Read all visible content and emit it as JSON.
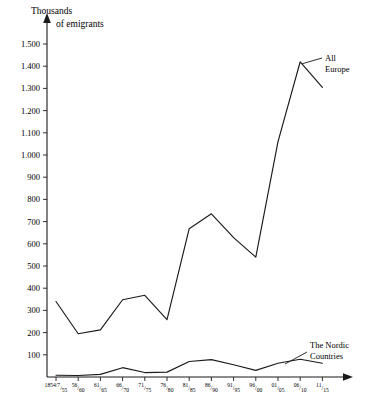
{
  "chart_data": {
    "type": "line",
    "title": "",
    "ylabel": "Thousands of emigrants",
    "ylabel_line1": "Thousands",
    "ylabel_line2": "of emigrants",
    "xlabel": "",
    "ylim": [
      0,
      1500
    ],
    "grid": false,
    "legend_position": "inline-right",
    "y_ticks": [
      100,
      200,
      300,
      400,
      500,
      600,
      700,
      800,
      900,
      1000,
      1100,
      1200,
      1300,
      1400,
      1500
    ],
    "y_tick_labels": [
      "100",
      "200",
      "300",
      "400",
      "500",
      "600",
      "700",
      "800",
      "900",
      "1.000",
      "1.100",
      "1.200",
      "1.300",
      "1.400",
      "1.500"
    ],
    "categories": [
      "1854/7-55",
      "56-60",
      "61-65",
      "66-70",
      "71-75",
      "76-80",
      "81-85",
      "86-90",
      "91-95",
      "96-00",
      "01-05",
      "06-10",
      "11-15"
    ],
    "x_tick_labels": [
      {
        "num": "1854/7",
        "den": "55"
      },
      {
        "num": "56",
        "den": "60"
      },
      {
        "num": "61",
        "den": "65"
      },
      {
        "num": "66",
        "den": "70"
      },
      {
        "num": "71",
        "den": "75"
      },
      {
        "num": "76",
        "den": "80"
      },
      {
        "num": "81",
        "den": "85"
      },
      {
        "num": "86",
        "den": "90"
      },
      {
        "num": "91",
        "den": "95"
      },
      {
        "num": "96",
        "den": "00"
      },
      {
        "num": "01",
        "den": "05"
      },
      {
        "num": "06",
        "den": "10"
      },
      {
        "num": "11",
        "den": "15"
      }
    ],
    "series": [
      {
        "name": "All Europe",
        "label_line1": "All",
        "label_line2": "Europe",
        "color": "#1a1a1a",
        "values": [
          340,
          195,
          212,
          348,
          368,
          258,
          668,
          735,
          628,
          540,
          1060,
          1420,
          1305
        ]
      },
      {
        "name": "The Nordic Countries",
        "label_line1": "The Nordic",
        "label_line2": "Countries",
        "color": "#1a1a1a",
        "values": [
          8,
          7,
          12,
          42,
          20,
          22,
          70,
          78,
          55,
          30,
          62,
          80,
          62
        ]
      }
    ]
  },
  "axes": {
    "arrow_up": "y-axis-arrow",
    "arrow_right": "x-axis-arrow"
  }
}
